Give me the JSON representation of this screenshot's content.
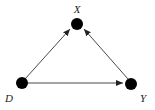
{
  "diagram": {
    "type": "directed-acyclic-graph",
    "nodes": [
      {
        "id": "X",
        "label": "X",
        "x": 77,
        "y": 25,
        "label_x": 77,
        "label_y": 13
      },
      {
        "id": "D",
        "label": "D",
        "x": 22,
        "y": 83,
        "label_x": 9,
        "label_y": 102
      },
      {
        "id": "Y",
        "label": "Y",
        "x": 131,
        "y": 83,
        "label_x": 143,
        "label_y": 102
      }
    ],
    "edges": [
      {
        "from": "D",
        "to": "X"
      },
      {
        "from": "D",
        "to": "Y"
      },
      {
        "from": "Y",
        "to": "X"
      }
    ],
    "colors": {
      "node": "#000000",
      "edge": "#333333",
      "background": "#ffffff"
    }
  }
}
